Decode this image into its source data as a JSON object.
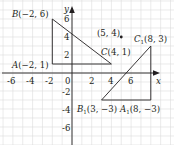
{
  "figure": {
    "type": "coordinate-plane-transformation",
    "axes": {
      "x_label": "x",
      "y_label": "y",
      "x_ticks": [
        "-6",
        "-4",
        "-2",
        "0",
        "2",
        "4",
        "6"
      ],
      "y_ticks": [
        "6",
        "4",
        "2",
        "-2",
        "-4",
        "-6"
      ],
      "origin_label": "0"
    },
    "triangle_original": {
      "vertices": [
        {
          "name": "A",
          "x": -2,
          "y": 1,
          "label": "A(−2, 1)"
        },
        {
          "name": "B",
          "x": -2,
          "y": 6,
          "label": "B(−2, 6)"
        },
        {
          "name": "C",
          "x": 4,
          "y": 1,
          "label": "C(4, 1)"
        }
      ]
    },
    "center_point": {
      "x": 5,
      "y": 4,
      "label": "(5, 4)"
    },
    "triangle_image": {
      "vertices": [
        {
          "name": "A1",
          "x": 8,
          "y": -3,
          "label": "A₁(8, −3)"
        },
        {
          "name": "B1",
          "x": 3,
          "y": -3,
          "label": "B₁(3, −3)"
        },
        {
          "name": "C1",
          "x": 8,
          "y": 3,
          "label": "C₁(8, 3)"
        }
      ]
    },
    "colors": {
      "ink": "#231f20",
      "grid": "#d9d9d9"
    }
  }
}
